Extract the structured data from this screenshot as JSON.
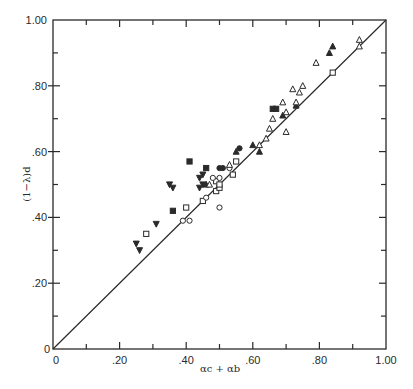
{
  "chart_data": {
    "type": "scatter",
    "title": "",
    "xlabel": "αc + αb",
    "ylabel": "(1−λ)d",
    "xlim": [
      0,
      1.0
    ],
    "ylim": [
      0,
      1.0
    ],
    "grid": false,
    "legend": null,
    "x_ticks": [
      "0",
      ".20",
      ".40",
      ".60",
      ".80",
      "1.00"
    ],
    "y_ticks": [
      "0",
      ".20",
      ".40",
      ".60",
      ".80",
      "1.00"
    ],
    "reference_line": {
      "label": "y = x",
      "from": [
        0,
        0
      ],
      "to": [
        1.0,
        1.0
      ]
    },
    "series": [
      {
        "name": "filled-square",
        "marker": "square-filled",
        "points": [
          [
            0.41,
            0.57
          ],
          [
            0.36,
            0.42
          ],
          [
            0.46,
            0.55
          ],
          [
            0.66,
            0.73
          ],
          [
            0.67,
            0.73
          ]
        ]
      },
      {
        "name": "open-square",
        "marker": "square-open",
        "points": [
          [
            0.28,
            0.35
          ],
          [
            0.4,
            0.43
          ],
          [
            0.45,
            0.45
          ],
          [
            0.49,
            0.48
          ],
          [
            0.5,
            0.49
          ],
          [
            0.49,
            0.51
          ],
          [
            0.5,
            0.5
          ],
          [
            0.55,
            0.57
          ],
          [
            0.54,
            0.53
          ],
          [
            0.84,
            0.84
          ]
        ]
      },
      {
        "name": "open-circle",
        "marker": "circle-open",
        "points": [
          [
            0.39,
            0.39
          ],
          [
            0.41,
            0.39
          ],
          [
            0.46,
            0.46
          ],
          [
            0.5,
            0.43
          ],
          [
            0.48,
            0.52
          ],
          [
            0.5,
            0.52
          ],
          [
            0.53,
            0.55
          ]
        ]
      },
      {
        "name": "filled-circle",
        "marker": "circle-filled",
        "points": [
          [
            0.5,
            0.55
          ],
          [
            0.56,
            0.61
          ],
          [
            0.51,
            0.55
          ]
        ]
      },
      {
        "name": "filled-down-triangle",
        "marker": "triangle-down-filled",
        "points": [
          [
            0.25,
            0.32
          ],
          [
            0.26,
            0.3
          ],
          [
            0.31,
            0.38
          ],
          [
            0.35,
            0.5
          ],
          [
            0.36,
            0.49
          ],
          [
            0.44,
            0.52
          ],
          [
            0.45,
            0.5
          ],
          [
            0.44,
            0.49
          ],
          [
            0.45,
            0.53
          ]
        ]
      },
      {
        "name": "filled-up-triangle",
        "marker": "triangle-up-filled",
        "points": [
          [
            0.46,
            0.5
          ],
          [
            0.55,
            0.6
          ],
          [
            0.6,
            0.62
          ],
          [
            0.62,
            0.6
          ],
          [
            0.69,
            0.71
          ],
          [
            0.73,
            0.74
          ],
          [
            0.83,
            0.9
          ],
          [
            0.84,
            0.92
          ]
        ]
      },
      {
        "name": "open-up-triangle",
        "marker": "triangle-up-open",
        "points": [
          [
            0.47,
            0.5
          ],
          [
            0.53,
            0.56
          ],
          [
            0.62,
            0.62
          ],
          [
            0.64,
            0.64
          ],
          [
            0.65,
            0.67
          ],
          [
            0.66,
            0.7
          ],
          [
            0.7,
            0.66
          ],
          [
            0.7,
            0.72
          ],
          [
            0.69,
            0.75
          ],
          [
            0.73,
            0.75
          ],
          [
            0.74,
            0.78
          ],
          [
            0.72,
            0.79
          ],
          [
            0.75,
            0.8
          ],
          [
            0.79,
            0.87
          ],
          [
            0.92,
            0.92
          ],
          [
            0.92,
            0.94
          ]
        ]
      }
    ]
  }
}
